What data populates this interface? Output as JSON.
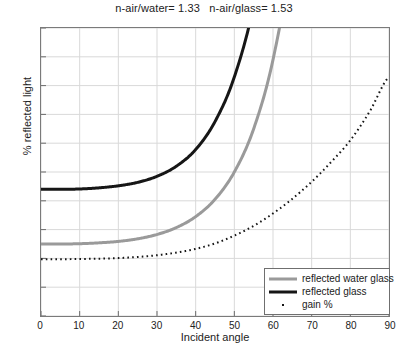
{
  "chart_data": {
    "type": "line",
    "title": "n-air/water= 1.33   n-air/glass= 1.53",
    "xlabel": "Incident angle",
    "ylabel": "% reflected light",
    "xlim": [
      0,
      90
    ],
    "ylim": [
      0,
      10
    ],
    "xticks": [
      0,
      10,
      20,
      30,
      40,
      50,
      60,
      70,
      80,
      90
    ],
    "yticks": [
      0,
      1,
      2,
      3,
      4,
      5,
      6,
      7,
      8,
      9,
      10
    ],
    "grid": true,
    "legend_position": "lower right",
    "x": [
      0,
      5,
      10,
      15,
      20,
      25,
      30,
      35,
      40,
      45,
      50,
      55,
      60,
      65,
      70,
      75,
      80,
      85,
      90
    ],
    "series": [
      {
        "name": "reflected water glass",
        "label": "reflected water glass",
        "color": "#9a9a9a",
        "style": "solid",
        "width": 3,
        "values": [
          2.5,
          2.5,
          2.51,
          2.54,
          2.59,
          2.68,
          2.83,
          3.07,
          3.45,
          4.05,
          5.0,
          6.5,
          8.9,
          12.8,
          19.2,
          29.6,
          46.0,
          69.0,
          100.0
        ]
      },
      {
        "name": "reflected glass",
        "label": "reflected glass",
        "color": "#161616",
        "style": "solid",
        "width": 3,
        "values": [
          4.4,
          4.4,
          4.41,
          4.45,
          4.52,
          4.64,
          4.85,
          5.2,
          5.78,
          6.75,
          8.3,
          10.8,
          14.9,
          21.4,
          31.8,
          47.5,
          68.5,
          88.0,
          100.0
        ]
      },
      {
        "name": "gain %",
        "label": "gain %",
        "color": "#161616",
        "style": "dotted",
        "width": 2,
        "values": [
          1.97,
          1.97,
          1.98,
          1.99,
          2.01,
          2.05,
          2.11,
          2.2,
          2.33,
          2.52,
          2.79,
          3.13,
          3.56,
          4.07,
          4.66,
          5.34,
          6.1,
          7.1,
          8.3
        ]
      }
    ]
  },
  "legend": {
    "items": [
      {
        "label": "reflected water glass",
        "sample": "line-gray"
      },
      {
        "label": "reflected glass",
        "sample": "line-black"
      },
      {
        "label": "gain %",
        "sample": "dot"
      }
    ]
  }
}
